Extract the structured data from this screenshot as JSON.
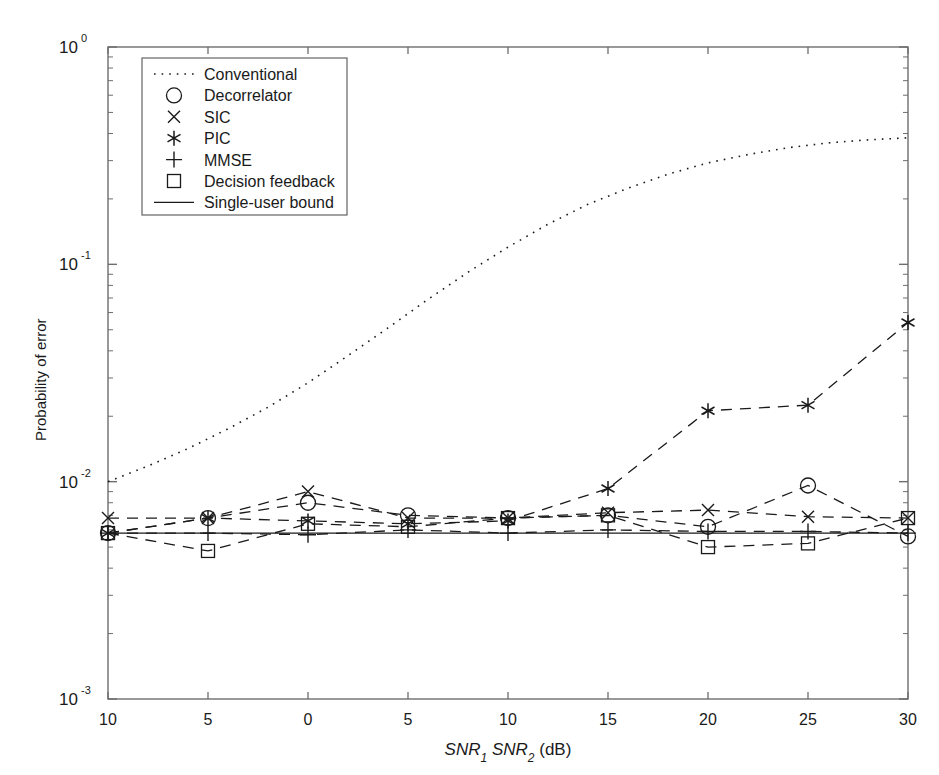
{
  "chart_data": {
    "type": "line",
    "title": "",
    "xlabel": "SNR₁ SNR₂ (dB)",
    "xlabel_parts": {
      "a": "SNR",
      "a_sub": "1",
      "b": "SNR",
      "b_sub": "2",
      "unit": "(dB)"
    },
    "ylabel": "Probability of error",
    "xlim": [
      -10,
      30
    ],
    "ylim": [
      0.001,
      1
    ],
    "yscale": "log",
    "xticks": [
      -10,
      -5,
      0,
      5,
      10,
      15,
      20,
      25,
      30
    ],
    "xticklabels": [
      "10",
      "5",
      "0",
      "5",
      "10",
      "15",
      "20",
      "25",
      "30"
    ],
    "yticks": [
      0.001,
      0.01,
      0.1,
      1
    ],
    "yticklabels": [
      "10^{-3}",
      "10^{-2}",
      "10^{-1}",
      "10^{0}"
    ],
    "ytick_mantissas": [
      "10",
      "10",
      "10",
      "10"
    ],
    "ytick_exponents": [
      "-3",
      "-2",
      "-1",
      "0"
    ],
    "grid": false,
    "legend_position": "upper left",
    "marker_x": [
      -10,
      -5,
      0,
      5,
      10,
      15,
      20,
      25,
      30
    ],
    "series": [
      {
        "name": "Conventional",
        "style": "dotted",
        "marker": "none",
        "x": [
          -10,
          -8,
          -6,
          -4,
          -2,
          0,
          2,
          4,
          6,
          8,
          10,
          12,
          14,
          16,
          18,
          20,
          22,
          24,
          26,
          28,
          30
        ],
        "values": [
          0.01,
          0.0118,
          0.0142,
          0.0175,
          0.022,
          0.0285,
          0.038,
          0.051,
          0.069,
          0.092,
          0.12,
          0.153,
          0.189,
          0.224,
          0.26,
          0.293,
          0.32,
          0.344,
          0.362,
          0.374,
          0.382
        ]
      },
      {
        "name": "Decorrelator",
        "style": "dashed",
        "marker": "circle",
        "x": [
          -10,
          -5,
          0,
          5,
          10,
          15,
          20,
          25,
          30
        ],
        "values": [
          0.0058,
          0.0068,
          0.008,
          0.007,
          0.0068,
          0.007,
          0.0062,
          0.0096,
          0.0056
        ]
      },
      {
        "name": "SIC",
        "style": "dashed",
        "marker": "x",
        "x": [
          -10,
          -5,
          0,
          5,
          10,
          15,
          20,
          25,
          30
        ],
        "values": [
          0.0068,
          0.0068,
          0.009,
          0.0068,
          0.0068,
          0.0072,
          0.0074,
          0.0069,
          0.0068
        ]
      },
      {
        "name": "PIC",
        "style": "dashed",
        "marker": "asterisk",
        "x": [
          -10,
          -5,
          0,
          5,
          10,
          15,
          20,
          25,
          30
        ],
        "values": [
          0.0058,
          0.0068,
          0.0066,
          0.0064,
          0.0066,
          0.0093,
          0.0212,
          0.0225,
          0.054
        ]
      },
      {
        "name": "MMSE",
        "style": "dashed",
        "marker": "plus",
        "x": [
          -10,
          -5,
          0,
          5,
          10,
          15,
          20,
          25,
          30
        ],
        "values": [
          0.0058,
          0.0058,
          0.0057,
          0.006,
          0.0058,
          0.006,
          0.0059,
          0.0059,
          0.0058
        ]
      },
      {
        "name": "Decision feedback",
        "style": "dashed",
        "marker": "square",
        "x": [
          -10,
          -5,
          0,
          5,
          10,
          15,
          20,
          25,
          30
        ],
        "values": [
          0.0058,
          0.0048,
          0.0064,
          0.0062,
          0.0068,
          0.007,
          0.005,
          0.0052,
          0.0068
        ]
      },
      {
        "name": "Single-user bound",
        "style": "solid",
        "marker": "none",
        "x": [
          -10,
          30
        ],
        "values": [
          0.0058,
          0.0058
        ]
      }
    ],
    "legend": [
      {
        "label": "Conventional",
        "style": "dotted",
        "marker": "none"
      },
      {
        "label": "Decorrelator",
        "style": "none",
        "marker": "circle"
      },
      {
        "label": "SIC",
        "style": "none",
        "marker": "x"
      },
      {
        "label": "PIC",
        "style": "none",
        "marker": "asterisk"
      },
      {
        "label": "MMSE",
        "style": "none",
        "marker": "plus"
      },
      {
        "label": "Decision feedback",
        "style": "none",
        "marker": "square"
      },
      {
        "label": "Single-user bound",
        "style": "solid",
        "marker": "none"
      }
    ]
  },
  "colors": {
    "axis": "#6e6e6e",
    "data": "#1a1a1a",
    "background": "#ffffff"
  }
}
